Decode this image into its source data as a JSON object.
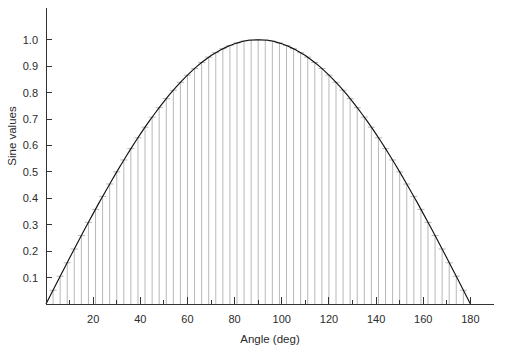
{
  "chart_data": {
    "type": "bar",
    "title": "",
    "subtitle": "",
    "xlabel": "Angle (deg)",
    "ylabel": "Sine values",
    "xlim": [
      0,
      190
    ],
    "ylim": [
      0,
      1.12
    ],
    "grid": false,
    "legend": null,
    "x_major_ticks": [
      0,
      20,
      40,
      60,
      80,
      100,
      120,
      140,
      160,
      180
    ],
    "x_major_tick_labels": [
      "",
      "20",
      "40",
      "60",
      "80",
      "100",
      "120",
      "140",
      "160",
      "180"
    ],
    "x_minor_ticks": [
      10,
      30,
      50,
      70,
      90,
      110,
      130,
      150,
      170
    ],
    "y_ticks": [
      0.1,
      0.2,
      0.3,
      0.4,
      0.5,
      0.6,
      0.7,
      0.8,
      0.9,
      1.0
    ],
    "y_tick_labels": [
      "0.1",
      "0.2",
      "0.3",
      "0.4",
      "0.5",
      "0.6",
      "0.7",
      "0.8",
      "0.9",
      "1.0"
    ],
    "series_name": "sin(angle)",
    "bar_color": "#9a9a9a",
    "curve_color": "#111111",
    "axis_color": "#333333",
    "bar_step_deg": 3,
    "x": [
      0,
      3,
      6,
      9,
      12,
      15,
      18,
      21,
      24,
      27,
      30,
      33,
      36,
      39,
      42,
      45,
      48,
      51,
      54,
      57,
      60,
      63,
      66,
      69,
      72,
      75,
      78,
      81,
      84,
      87,
      90,
      93,
      96,
      99,
      102,
      105,
      108,
      111,
      114,
      117,
      120,
      123,
      126,
      129,
      132,
      135,
      138,
      141,
      144,
      147,
      150,
      153,
      156,
      159,
      162,
      165,
      168,
      171,
      174,
      177
    ],
    "values": [
      0.0,
      0.052,
      0.105,
      0.156,
      0.208,
      0.259,
      0.309,
      0.358,
      0.407,
      0.454,
      0.5,
      0.545,
      0.588,
      0.629,
      0.669,
      0.707,
      0.743,
      0.777,
      0.809,
      0.839,
      0.866,
      0.891,
      0.914,
      0.934,
      0.951,
      0.966,
      0.978,
      0.988,
      0.995,
      0.999,
      1.0,
      0.999,
      0.995,
      0.988,
      0.978,
      0.966,
      0.951,
      0.934,
      0.914,
      0.891,
      0.866,
      0.839,
      0.809,
      0.777,
      0.743,
      0.707,
      0.669,
      0.629,
      0.588,
      0.545,
      0.5,
      0.454,
      0.407,
      0.358,
      0.309,
      0.259,
      0.208,
      0.156,
      0.105,
      0.052
    ],
    "curve_x": [
      0,
      2,
      4,
      6,
      8,
      10,
      12,
      14,
      16,
      18,
      20,
      22,
      24,
      26,
      28,
      30,
      32,
      34,
      36,
      38,
      40,
      42,
      44,
      46,
      48,
      50,
      52,
      54,
      56,
      58,
      60,
      62,
      64,
      66,
      68,
      70,
      72,
      74,
      76,
      78,
      80,
      82,
      84,
      86,
      88,
      90,
      92,
      94,
      96,
      98,
      100,
      102,
      104,
      106,
      108,
      110,
      112,
      114,
      116,
      118,
      120,
      122,
      124,
      126,
      128,
      130,
      132,
      134,
      136,
      138,
      140,
      142,
      144,
      146,
      148,
      150,
      152,
      154,
      156,
      158,
      160,
      162,
      164,
      166,
      168,
      170,
      172,
      174,
      176,
      178,
      180
    ],
    "curve_y": [
      0.0,
      0.035,
      0.07,
      0.105,
      0.139,
      0.174,
      0.208,
      0.242,
      0.276,
      0.309,
      0.342,
      0.375,
      0.407,
      0.438,
      0.469,
      0.5,
      0.53,
      0.559,
      0.588,
      0.616,
      0.643,
      0.669,
      0.695,
      0.719,
      0.743,
      0.766,
      0.788,
      0.809,
      0.829,
      0.848,
      0.866,
      0.883,
      0.899,
      0.914,
      0.927,
      0.94,
      0.951,
      0.961,
      0.97,
      0.978,
      0.985,
      0.99,
      0.995,
      0.998,
      0.999,
      1.0,
      0.999,
      0.998,
      0.995,
      0.99,
      0.985,
      0.978,
      0.97,
      0.961,
      0.951,
      0.94,
      0.927,
      0.914,
      0.899,
      0.883,
      0.866,
      0.848,
      0.829,
      0.809,
      0.788,
      0.766,
      0.743,
      0.719,
      0.695,
      0.669,
      0.643,
      0.616,
      0.588,
      0.559,
      0.53,
      0.5,
      0.469,
      0.438,
      0.407,
      0.375,
      0.342,
      0.309,
      0.276,
      0.242,
      0.208,
      0.174,
      0.139,
      0.105,
      0.07,
      0.035,
      0.0
    ]
  }
}
